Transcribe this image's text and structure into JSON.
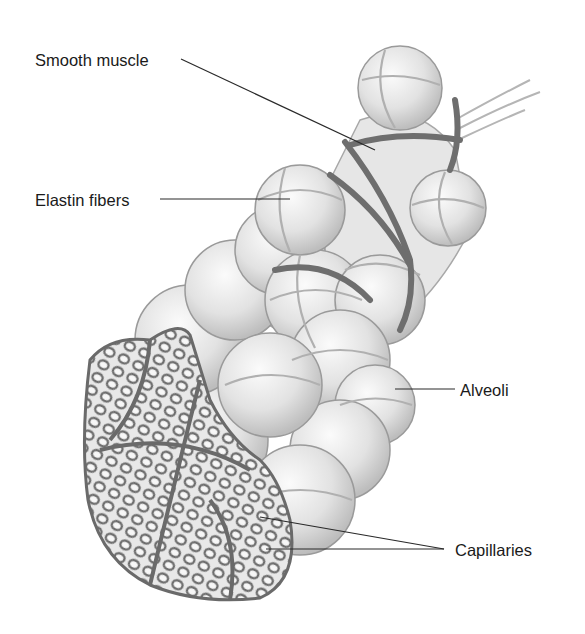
{
  "diagram": {
    "labels": [
      {
        "id": "smooth-muscle",
        "text": "Smooth muscle",
        "x": 35,
        "y": 52
      },
      {
        "id": "elastin-fibers",
        "text": "Elastin fibers",
        "x": 35,
        "y": 192
      },
      {
        "id": "alveoli",
        "text": "Alveoli",
        "x": 460,
        "y": 385
      },
      {
        "id": "capillaries",
        "text": "Capillaries",
        "x": 455,
        "y": 545
      }
    ],
    "colors": {
      "background": "#ffffff",
      "text": "#1a1a1a",
      "leader": "#2a2a2a",
      "alveolus_fill": "#e4e4e4",
      "alveolus_stroke": "#9a9a9a",
      "muscle": "#6e6e6e",
      "capillary": "#777777"
    }
  }
}
